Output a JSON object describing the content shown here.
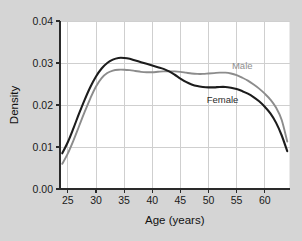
{
  "chart_data": {
    "type": "line",
    "title": "",
    "xlabel": "Age (years)",
    "ylabel": "Density",
    "xlim": [
      23.6,
      64.4
    ],
    "ylim": [
      0.0,
      0.04
    ],
    "xticks": [
      25,
      30,
      35,
      40,
      45,
      50,
      55,
      60
    ],
    "xtick_labels": [
      "25",
      "30",
      "35",
      "40",
      "45",
      "50",
      "55",
      "60"
    ],
    "yticks": [
      0.0,
      0.01,
      0.02,
      0.03,
      0.04
    ],
    "ytick_labels": [
      "0.00",
      "0.01",
      "0.02",
      "0.03",
      "0.04"
    ],
    "grid": true,
    "legend_position": "inline-annotation",
    "x": [
      24,
      25,
      26,
      27,
      28,
      29,
      30,
      31,
      32,
      33,
      34,
      35,
      36,
      37,
      38,
      39,
      40,
      41,
      42,
      43,
      44,
      45,
      46,
      47,
      48,
      49,
      50,
      51,
      52,
      53,
      54,
      55,
      56,
      57,
      58,
      59,
      60,
      61,
      62,
      63,
      64
    ],
    "series": [
      {
        "name": "Female",
        "color": "#1c1c1c",
        "label": "Female",
        "label_x": 52.5,
        "label_y": 0.0205,
        "values": [
          0.0085,
          0.0112,
          0.0145,
          0.018,
          0.0213,
          0.0243,
          0.0268,
          0.0287,
          0.03,
          0.0308,
          0.0312,
          0.0312,
          0.031,
          0.0306,
          0.0302,
          0.0298,
          0.0294,
          0.029,
          0.0286,
          0.028,
          0.0272,
          0.0263,
          0.0255,
          0.0249,
          0.0245,
          0.0243,
          0.0242,
          0.0242,
          0.0243,
          0.0243,
          0.0241,
          0.0238,
          0.0233,
          0.0227,
          0.0219,
          0.0209,
          0.0196,
          0.018,
          0.0158,
          0.0128,
          0.009
        ]
      },
      {
        "name": "Male",
        "color": "#8c8c8c",
        "label": "Male",
        "label_x": 56.0,
        "label_y": 0.0285,
        "values": [
          0.006,
          0.0085,
          0.0116,
          0.015,
          0.0184,
          0.0216,
          0.0244,
          0.0264,
          0.0276,
          0.0282,
          0.0284,
          0.0284,
          0.0283,
          0.0281,
          0.0279,
          0.0278,
          0.0278,
          0.0279,
          0.028,
          0.028,
          0.028,
          0.0279,
          0.0277,
          0.0275,
          0.0274,
          0.0274,
          0.0275,
          0.0276,
          0.0277,
          0.0277,
          0.0275,
          0.0271,
          0.0265,
          0.0258,
          0.0249,
          0.0239,
          0.0227,
          0.0213,
          0.0194,
          0.0165,
          0.0113
        ]
      }
    ]
  },
  "axes": {
    "x_title": "Age (years)",
    "y_title": "Density"
  }
}
